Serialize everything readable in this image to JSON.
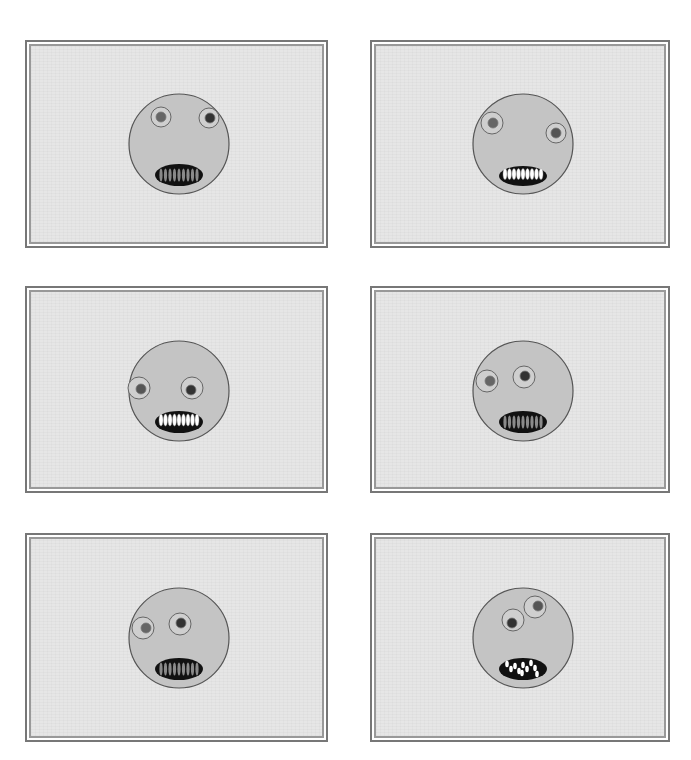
{
  "figure": {
    "layout": {
      "rows": 3,
      "cols": 2
    },
    "colors": {
      "background": "#ffffff",
      "panel_bg": "#e6e6e6",
      "frame_outer": "#777777",
      "frame_inner": "#999999",
      "face_fill": "#c4c4c4",
      "face_stroke": "#555555",
      "eye_white": "#cfcfcf",
      "pupil": "#444444",
      "mouth": "#111111",
      "teeth_light": "#ffffff",
      "teeth_dark": "#888888"
    },
    "panels": [
      {
        "id": "top-left",
        "x": 25,
        "y": 40,
        "w": 303,
        "h": 208,
        "face": {
          "cx": 177,
          "cy": 142,
          "r": 50,
          "left_eye": {
            "dx": -18,
            "dy": -27,
            "r": 10,
            "pdx": 0,
            "pdy": 0,
            "pr": 5,
            "pupil": "#666666"
          },
          "right_eye": {
            "dx": 30,
            "dy": -26,
            "r": 10,
            "pdx": 1,
            "pdy": 0,
            "pr": 5,
            "pupil": "#333333"
          },
          "mouth": {
            "dy": 31,
            "rx": 24,
            "ry": 11,
            "teeth": "dim"
          }
        }
      },
      {
        "id": "top-right",
        "x": 370,
        "y": 40,
        "w": 300,
        "h": 208,
        "face": {
          "cx": 521,
          "cy": 142,
          "r": 50,
          "left_eye": {
            "dx": -31,
            "dy": -21,
            "r": 11,
            "pdx": 1,
            "pdy": 0,
            "pr": 5,
            "pupil": "#666666"
          },
          "right_eye": {
            "dx": 33,
            "dy": -11,
            "r": 10,
            "pdx": 0,
            "pdy": 0,
            "pr": 5,
            "pupil": "#555555"
          },
          "mouth": {
            "dy": 32,
            "rx": 24,
            "ry": 10,
            "teeth": "bright"
          }
        }
      },
      {
        "id": "middle-left",
        "x": 25,
        "y": 286,
        "w": 303,
        "h": 207,
        "face": {
          "cx": 177,
          "cy": 389,
          "r": 50,
          "left_eye": {
            "dx": -40,
            "dy": -3,
            "r": 11,
            "pdx": 2,
            "pdy": 1,
            "pr": 5,
            "pupil": "#555555"
          },
          "right_eye": {
            "dx": 13,
            "dy": -3,
            "r": 11,
            "pdx": -1,
            "pdy": 2,
            "pr": 5,
            "pupil": "#333333"
          },
          "mouth": {
            "dy": 31,
            "rx": 24,
            "ry": 11,
            "teeth": "bright"
          }
        }
      },
      {
        "id": "middle-right",
        "x": 370,
        "y": 286,
        "w": 300,
        "h": 207,
        "face": {
          "cx": 521,
          "cy": 389,
          "r": 50,
          "left_eye": {
            "dx": -36,
            "dy": -10,
            "r": 11,
            "pdx": 3,
            "pdy": 0,
            "pr": 5,
            "pupil": "#666666"
          },
          "right_eye": {
            "dx": 1,
            "dy": -14,
            "r": 11,
            "pdx": 1,
            "pdy": -1,
            "pr": 5,
            "pupil": "#333333"
          },
          "mouth": {
            "dy": 31,
            "rx": 24,
            "ry": 11,
            "teeth": "dim"
          }
        }
      },
      {
        "id": "bottom-left",
        "x": 25,
        "y": 533,
        "w": 303,
        "h": 209,
        "face": {
          "cx": 177,
          "cy": 636,
          "r": 50,
          "left_eye": {
            "dx": -36,
            "dy": -10,
            "r": 11,
            "pdx": 3,
            "pdy": 0,
            "pr": 5,
            "pupil": "#666666"
          },
          "right_eye": {
            "dx": 1,
            "dy": -14,
            "r": 11,
            "pdx": 1,
            "pdy": -1,
            "pr": 5,
            "pupil": "#333333"
          },
          "mouth": {
            "dy": 31,
            "rx": 24,
            "ry": 11,
            "teeth": "dim"
          }
        }
      },
      {
        "id": "bottom-right",
        "x": 370,
        "y": 533,
        "w": 300,
        "h": 209,
        "face": {
          "cx": 521,
          "cy": 636,
          "r": 50,
          "left_eye": {
            "dx": -10,
            "dy": -18,
            "r": 11,
            "pdx": -1,
            "pdy": 3,
            "pr": 5,
            "pupil": "#333333"
          },
          "right_eye": {
            "dx": 12,
            "dy": -31,
            "r": 11,
            "pdx": 3,
            "pdy": -1,
            "pr": 5,
            "pupil": "#555555"
          },
          "mouth": {
            "dy": 31,
            "rx": 24,
            "ry": 11,
            "teeth": "fangs"
          }
        }
      }
    ]
  }
}
